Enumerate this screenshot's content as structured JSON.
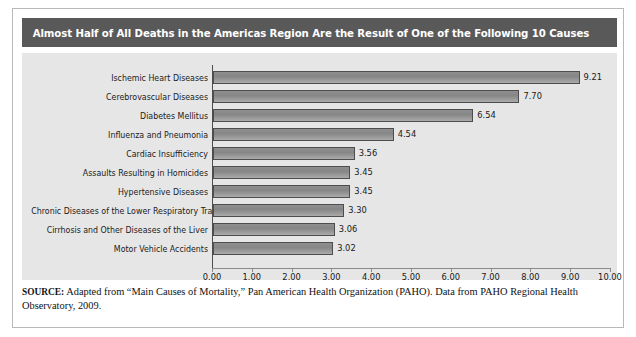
{
  "title": "Almost Half of All Deaths in the Americas Region Are the Result of One of the Following 10 Causes",
  "source": {
    "label": "SOURCE:",
    "text": " Adapted from “Main Causes of Mortality,” Pan American Health Organization (PAHO). Data from PAHO Regional Health Observatory, 2009."
  },
  "colors": {
    "title_bar": "#595959",
    "panel_background": "#e6e6e6",
    "bar_fill": "#8f8f8f",
    "bar_border": "#4d4d4d",
    "axis": "#8a8a8a",
    "text": "#1a1a1a",
    "frame": "#b8b8b8"
  },
  "chart_data": {
    "type": "bar",
    "orientation": "horizontal",
    "title": "Almost Half of All Deaths in the Americas Region Are the Result of One of the Following 10 Causes",
    "xlabel": "",
    "ylabel": "",
    "xlim": [
      0.0,
      10.0
    ],
    "xticks": [
      "0.00",
      "1.00",
      "2.00",
      "3.00",
      "4.00",
      "5.00",
      "6.00",
      "7.00",
      "8.00",
      "9.00",
      "10.00"
    ],
    "grid": false,
    "legend": false,
    "categories": [
      "Ischemic Heart Diseases",
      "Cerebrovascular Diseases",
      "Diabetes Mellitus",
      "Influenza and Pneumonia",
      "Cardiac Insufficiency",
      "Assaults Resulting in Homicides",
      "Hypertensive Diseases",
      "Chronic Diseases of the Lower Respiratory Tracts",
      "Cirrhosis and Other Diseases of the Liver",
      "Motor Vehicle Accidents"
    ],
    "values": [
      9.21,
      7.7,
      6.54,
      4.54,
      3.56,
      3.45,
      3.45,
      3.3,
      3.06,
      3.02
    ],
    "value_labels": [
      "9.21",
      "7.70",
      "6.54",
      "4.54",
      "3.56",
      "3.45",
      "3.45",
      "3.30",
      "3.06",
      "3.02"
    ]
  }
}
